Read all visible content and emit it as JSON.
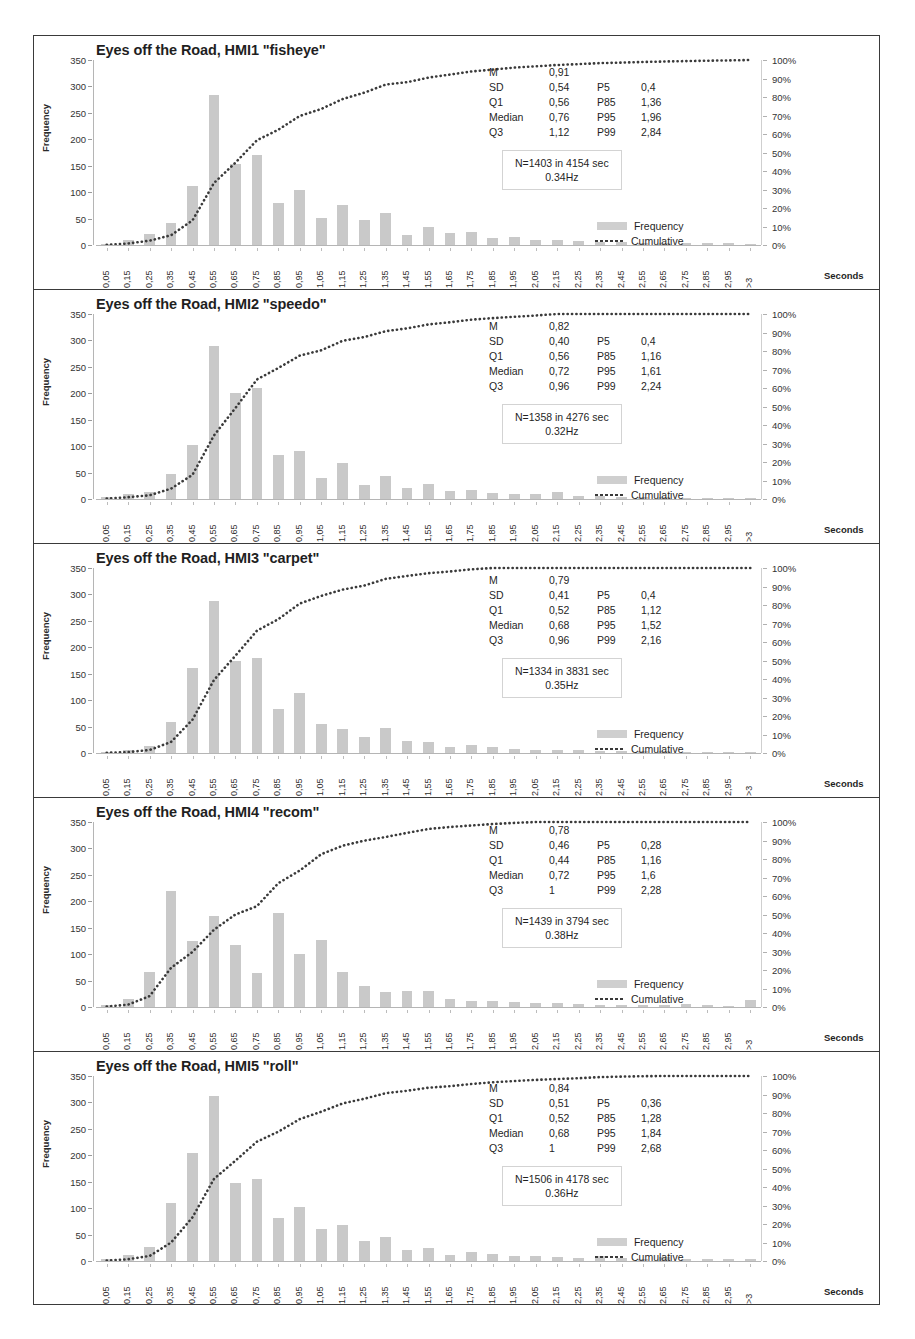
{
  "figure": {
    "axis_y_label": "Frequency",
    "axis_x_label": "Seconds",
    "y_ticks": [
      "0",
      "50",
      "100",
      "150",
      "200",
      "250",
      "300",
      "350"
    ],
    "y_ticks_right": [
      "0%",
      "10%",
      "20%",
      "30%",
      "40%",
      "50%",
      "60%",
      "70%",
      "80%",
      "90%",
      "100%"
    ],
    "x_ticks": [
      "0,05",
      "0,15",
      "0,25",
      "0,35",
      "0,45",
      "0,55",
      "0,65",
      "0,75",
      "0,85",
      "0,95",
      "1,05",
      "1,15",
      "1,25",
      "1,35",
      "1,45",
      "1,55",
      "1,65",
      "1,75",
      "1,85",
      "1,95",
      "2,05",
      "2,15",
      "2,25",
      "2,35",
      "2,45",
      "2,55",
      "2,65",
      "2,75",
      "2,85",
      "2,95",
      ">3"
    ],
    "legend": {
      "frequency": "Frequency",
      "cumulative": "Cumulative"
    },
    "stat_labels": {
      "m": "M",
      "sd": "SD",
      "q1": "Q1",
      "median": "Median",
      "q3": "Q3",
      "p5": "P5",
      "p85": "P85",
      "p95": "P95",
      "p99": "P99"
    },
    "colors": {
      "bar": "#c9c9c9",
      "curve": "#3a3a3a",
      "frame": "#3a3a3a",
      "axis": "#b5b5b5"
    }
  },
  "chart_data": [
    {
      "type": "bar",
      "title": "Eyes off the Road, HMI1 \"fisheye\"",
      "xlabel": "Seconds",
      "ylabel": "Frequency",
      "ylim": [
        0,
        350
      ],
      "ylim_right": [
        0,
        1
      ],
      "grid": false,
      "legend_position": "right",
      "categories": [
        "0,05",
        "0,15",
        "0,25",
        "0,35",
        "0,45",
        "0,55",
        "0,65",
        "0,75",
        "0,85",
        "0,95",
        "1,05",
        "1,15",
        "1,25",
        "1,35",
        "1,45",
        "1,55",
        "1,65",
        "1,75",
        "1,85",
        "1,95",
        "2,05",
        "2,15",
        "2,25",
        "2,35",
        "2,45",
        "2,55",
        "2,65",
        "2,75",
        "2,85",
        "2,95",
        ">3"
      ],
      "series": [
        {
          "name": "Frequency",
          "values": [
            2,
            9,
            21,
            42,
            112,
            284,
            154,
            170,
            80,
            105,
            52,
            75,
            48,
            61,
            19,
            35,
            22,
            24,
            14,
            16,
            9,
            10,
            8,
            6,
            5,
            4,
            4,
            3,
            3,
            3,
            2
          ]
        },
        {
          "name": "Cumulative",
          "values": [
            0.001,
            0.008,
            0.023,
            0.053,
            0.133,
            0.335,
            0.445,
            0.566,
            0.623,
            0.698,
            0.735,
            0.789,
            0.823,
            0.867,
            0.88,
            0.905,
            0.921,
            0.938,
            0.948,
            0.959,
            0.966,
            0.973,
            0.978,
            0.983,
            0.986,
            0.989,
            0.992,
            0.994,
            0.996,
            0.998,
            1.0
          ]
        }
      ],
      "stats": {
        "M": "0,91",
        "SD": "0,54",
        "Q1": "0,56",
        "Median": "0,76",
        "Q3": "1,12",
        "P5": "0,4",
        "P85": "1,36",
        "P95": "1,96",
        "P99": "2,84"
      },
      "note_line1": "N=1403 in 4154 sec",
      "note_line2": "0.34Hz"
    },
    {
      "type": "bar",
      "title": "Eyes off the Road, HMI2 \"speedo\"",
      "xlabel": "Seconds",
      "ylabel": "Frequency",
      "ylim": [
        0,
        350
      ],
      "ylim_right": [
        0,
        1
      ],
      "grid": false,
      "legend_position": "right",
      "categories": [
        "0,05",
        "0,15",
        "0,25",
        "0,35",
        "0,45",
        "0,55",
        "0,65",
        "0,75",
        "0,85",
        "0,95",
        "1,05",
        "1,15",
        "1,25",
        "1,35",
        "1,45",
        "1,55",
        "1,65",
        "1,75",
        "1,85",
        "1,95",
        "2,05",
        "2,15",
        "2,25",
        "2,35",
        "2,45",
        "2,55",
        "2,65",
        "2,75",
        "2,85",
        "2,95",
        ">3"
      ],
      "series": [
        {
          "name": "Frequency",
          "values": [
            3,
            10,
            14,
            48,
            102,
            289,
            200,
            210,
            84,
            91,
            39,
            69,
            27,
            43,
            21,
            29,
            16,
            18,
            12,
            10,
            9,
            14,
            6,
            5,
            4,
            3,
            3,
            2,
            2,
            2,
            2
          ]
        },
        {
          "name": "Cumulative",
          "values": [
            0.002,
            0.01,
            0.02,
            0.056,
            0.131,
            0.344,
            0.492,
            0.646,
            0.708,
            0.775,
            0.804,
            0.855,
            0.875,
            0.907,
            0.922,
            0.944,
            0.955,
            0.969,
            0.978,
            0.985,
            0.992,
            1.002,
            1.0,
            1.0,
            1.0,
            1.0,
            1.0,
            1.0,
            1.0,
            1.0,
            1.0
          ]
        }
      ],
      "stats": {
        "M": "0,82",
        "SD": "0,40",
        "Q1": "0,56",
        "Median": "0,72",
        "Q3": "0,96",
        "P5": "0,4",
        "P85": "1,16",
        "P95": "1,61",
        "P99": "2,24"
      },
      "note_line1": "N=1358 in 4276 sec",
      "note_line2": "0.32Hz"
    },
    {
      "type": "bar",
      "title": "Eyes off the Road, HMI3 \"carpet\"",
      "xlabel": "Seconds",
      "ylabel": "Frequency",
      "ylim": [
        0,
        350
      ],
      "ylim_right": [
        0,
        1
      ],
      "grid": false,
      "legend_position": "right",
      "categories": [
        "0,05",
        "0,15",
        "0,25",
        "0,35",
        "0,45",
        "0,55",
        "0,65",
        "0,75",
        "0,85",
        "0,95",
        "1,05",
        "1,15",
        "1,25",
        "1,35",
        "1,45",
        "1,55",
        "1,65",
        "1,75",
        "1,85",
        "1,95",
        "2,05",
        "2,15",
        "2,25",
        "2,35",
        "2,45",
        "2,55",
        "2,65",
        "2,75",
        "2,85",
        "2,95",
        ">3"
      ],
      "series": [
        {
          "name": "Frequency",
          "values": [
            2,
            5,
            14,
            59,
            160,
            287,
            175,
            180,
            83,
            113,
            55,
            45,
            30,
            47,
            22,
            20,
            12,
            16,
            11,
            8,
            6,
            5,
            5,
            4,
            3,
            3,
            3,
            2,
            2,
            2,
            2
          ]
        },
        {
          "name": "Cumulative",
          "values": [
            0.001,
            0.005,
            0.016,
            0.06,
            0.18,
            0.395,
            0.526,
            0.661,
            0.723,
            0.808,
            0.849,
            0.883,
            0.905,
            0.941,
            0.957,
            0.972,
            0.981,
            0.993,
            1.0,
            1.0,
            1.0,
            1.0,
            1.0,
            1.0,
            1.0,
            1.0,
            1.0,
            1.0,
            1.0,
            1.0,
            1.0
          ]
        }
      ],
      "stats": {
        "M": "0,79",
        "SD": "0,41",
        "Q1": "0,52",
        "Median": "0,68",
        "Q3": "0,96",
        "P5": "0,4",
        "P85": "1,12",
        "P95": "1,52",
        "P99": "2,16"
      },
      "note_line1": "N=1334 in 3831 sec",
      "note_line2": "0.35Hz"
    },
    {
      "type": "bar",
      "title": "Eyes off the Road, HMI4 \"recom\"",
      "xlabel": "Seconds",
      "ylabel": "Frequency",
      "ylim": [
        0,
        350
      ],
      "ylim_right": [
        0,
        1
      ],
      "grid": false,
      "legend_position": "right",
      "categories": [
        "0,05",
        "0,15",
        "0,25",
        "0,35",
        "0,45",
        "0,55",
        "0,65",
        "0,75",
        "0,85",
        "0,95",
        "1,05",
        "1,15",
        "1,25",
        "1,35",
        "1,45",
        "1,55",
        "1,65",
        "1,75",
        "1,85",
        "1,95",
        "2,05",
        "2,15",
        "2,25",
        "2,35",
        "2,45",
        "2,55",
        "2,65",
        "2,75",
        "2,85",
        "2,95",
        ">3"
      ],
      "series": [
        {
          "name": "Frequency",
          "values": [
            3,
            15,
            66,
            220,
            124,
            172,
            118,
            65,
            178,
            100,
            127,
            66,
            39,
            29,
            31,
            30,
            16,
            12,
            11,
            9,
            8,
            7,
            5,
            4,
            4,
            3,
            3,
            5,
            3,
            2,
            14
          ]
        },
        {
          "name": "Cumulative",
          "values": [
            0.002,
            0.013,
            0.059,
            0.212,
            0.298,
            0.418,
            0.5,
            0.545,
            0.669,
            0.738,
            0.826,
            0.872,
            0.899,
            0.919,
            0.941,
            0.962,
            0.973,
            0.981,
            0.989,
            0.995,
            1.0,
            1.0,
            1.0,
            1.0,
            1.0,
            1.0,
            1.0,
            1.0,
            1.0,
            1.0,
            1.0
          ]
        }
      ],
      "stats": {
        "M": "0,78",
        "SD": "0,46",
        "Q1": "0,44",
        "Median": "0,72",
        "Q3": "1",
        "P5": "0,28",
        "P85": "1,16",
        "P95": "1,6",
        "P99": "2,28"
      },
      "note_line1": "N=1439 in 3794 sec",
      "note_line2": "0.38Hz"
    },
    {
      "type": "bar",
      "title": "Eyes off the Road, HMI5 \"roll\"",
      "xlabel": "Seconds",
      "ylabel": "Frequency",
      "ylim": [
        0,
        350
      ],
      "ylim_right": [
        0,
        1
      ],
      "grid": false,
      "legend_position": "right",
      "categories": [
        "0,05",
        "0,15",
        "0,25",
        "0,35",
        "0,45",
        "0,55",
        "0,65",
        "0,75",
        "0,85",
        "0,95",
        "1,05",
        "1,15",
        "1,25",
        "1,35",
        "1,45",
        "1,55",
        "1,65",
        "1,75",
        "1,85",
        "1,95",
        "2,05",
        "2,15",
        "2,25",
        "2,35",
        "2,45",
        "2,55",
        "2,65",
        "2,75",
        "2,85",
        "2,95",
        ">3"
      ],
      "series": [
        {
          "name": "Frequency",
          "values": [
            3,
            12,
            26,
            110,
            205,
            313,
            147,
            155,
            82,
            102,
            60,
            68,
            38,
            45,
            20,
            25,
            12,
            18,
            14,
            10,
            9,
            8,
            6,
            9,
            5,
            4,
            7,
            4,
            3,
            3,
            3
          ]
        },
        {
          "name": "Cumulative",
          "values": [
            0.002,
            0.01,
            0.027,
            0.1,
            0.236,
            0.444,
            0.542,
            0.645,
            0.699,
            0.767,
            0.807,
            0.852,
            0.877,
            0.907,
            0.92,
            0.937,
            0.945,
            0.957,
            0.966,
            0.973,
            0.979,
            0.984,
            0.988,
            0.994,
            0.997,
            0.999,
            1.0,
            1.0,
            1.0,
            1.0,
            1.0
          ]
        }
      ],
      "stats": {
        "M": "0,84",
        "SD": "0,51",
        "Q1": "0,52",
        "Median": "0,68",
        "Q3": "1",
        "P5": "0,36",
        "P85": "1,28",
        "P95": "1,84",
        "P99": "2,68"
      },
      "note_line1": "N=1506 in 4178 sec",
      "note_line2": "0.36Hz"
    }
  ]
}
